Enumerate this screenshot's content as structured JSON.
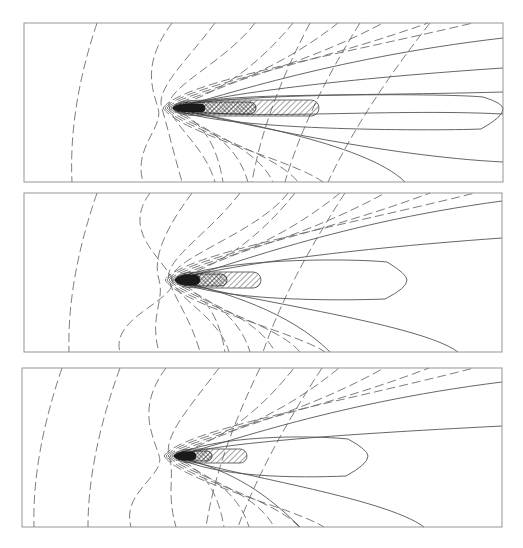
{
  "figure": {
    "width": 523,
    "height": 548,
    "background": "#ffffff"
  },
  "chart_data": [
    {
      "type": "heatmap",
      "subtype": "contour",
      "title": "",
      "xlabel": "",
      "ylabel": "",
      "grid": false,
      "legend": "none",
      "panel_index": 1,
      "frame": {
        "x": 24,
        "y": 23,
        "width": 479,
        "height": 159
      },
      "source": {
        "x": 173,
        "y": 108
      },
      "core": {
        "dark": {
          "x0": 173,
          "x1": 205,
          "ry": 4
        },
        "crosshatch": {
          "x0": 173,
          "x1": 256,
          "ry": 6
        },
        "hatch": {
          "x0": 173,
          "x1": 319,
          "ry": 8
        }
      },
      "dashed_contours": [
        {
          "top_x": 97,
          "bottom_x": 72,
          "bulge": 0
        },
        {
          "top_x": 172,
          "bottom_x": 143,
          "bulge": -25
        },
        {
          "top_x": 215,
          "bottom_x": 182,
          "bulge": -12
        },
        {
          "top_x": 255,
          "bottom_x": 215,
          "bulge": -6
        },
        {
          "top_x": 310,
          "bottom_x": 252,
          "bulge": -3
        },
        {
          "top_x": 360,
          "bottom_x": 285,
          "bulge": -2
        },
        {
          "top_x": 430,
          "bottom_x": 328,
          "bulge": -1
        }
      ],
      "solid_contours_upper_exit_y": [
        38,
        68,
        92
      ],
      "solid_contours_lower_exit": [
        {
          "side": "bottom",
          "x": 405
        },
        {
          "side": "right",
          "y": 162
        },
        {
          "side": "right",
          "y": 114
        }
      ],
      "closed_contour": {
        "x1": 503,
        "top_y": 93,
        "bottom_y": 131,
        "tip_y": 109
      }
    },
    {
      "type": "heatmap",
      "subtype": "contour",
      "title": "",
      "xlabel": "",
      "ylabel": "",
      "grid": false,
      "legend": "none",
      "panel_index": 2,
      "frame": {
        "x": 24,
        "y": 193,
        "width": 478,
        "height": 159
      },
      "source": {
        "x": 175,
        "y": 280
      },
      "core": {
        "dark": {
          "x0": 175,
          "x1": 200,
          "ry": 5
        },
        "crosshatch": {
          "x0": 175,
          "x1": 227,
          "ry": 6
        },
        "hatch": {
          "x0": 175,
          "x1": 261,
          "ry": 8
        }
      },
      "dashed_contours": [
        {
          "top_x": 97,
          "bottom_x": 69,
          "bulge": 0
        },
        {
          "top_x": 150,
          "bottom_x": 120,
          "bulge": -5
        },
        {
          "top_x": 192,
          "bottom_x": 159,
          "bulge": -20
        },
        {
          "top_x": 240,
          "bottom_x": 200,
          "bulge": -10
        },
        {
          "top_x": 288,
          "bottom_x": 229,
          "bulge": -5
        },
        {
          "top_x": 345,
          "bottom_x": 263,
          "bulge": -2
        }
      ],
      "solid_contours_upper_exit_y": [
        201,
        238
      ],
      "solid_contours_lower_exit": [
        {
          "side": "bottom",
          "x": 330
        },
        {
          "side": "bottom",
          "x": 458
        }
      ],
      "closed_contour": {
        "x1": 407,
        "top_y": 258,
        "bottom_y": 301,
        "tip_y": 280
      }
    },
    {
      "type": "heatmap",
      "subtype": "contour",
      "title": "",
      "xlabel": "",
      "ylabel": "",
      "grid": false,
      "legend": "none",
      "panel_index": 3,
      "frame": {
        "x": 22,
        "y": 368,
        "width": 480,
        "height": 159
      },
      "source": {
        "x": 174,
        "y": 456
      },
      "core": {
        "dark": {
          "x0": 174,
          "x1": 196,
          "ry": 4
        },
        "crosshatch": {
          "x0": 174,
          "x1": 212,
          "ry": 5
        },
        "hatch": {
          "x0": 174,
          "x1": 247,
          "ry": 7
        }
      },
      "dashed_contours": [
        {
          "top_x": 62,
          "bottom_x": 34,
          "bulge": 0
        },
        {
          "top_x": 120,
          "bottom_x": 88,
          "bulge": -3
        },
        {
          "top_x": 166,
          "bottom_x": 131,
          "bulge": -18
        },
        {
          "top_x": 219,
          "bottom_x": 176,
          "bulge": -8
        },
        {
          "top_x": 260,
          "bottom_x": 206,
          "bulge": -4
        },
        {
          "top_x": 322,
          "bottom_x": 238,
          "bulge": -2
        }
      ],
      "solid_contours_upper_exit_y": [
        382,
        426
      ],
      "solid_contours_lower_exit": [
        {
          "side": "bottom",
          "x": 300
        },
        {
          "side": "bottom",
          "x": 424
        }
      ],
      "closed_contour": {
        "x1": 368,
        "top_y": 435,
        "bottom_y": 478,
        "tip_y": 456
      }
    }
  ]
}
